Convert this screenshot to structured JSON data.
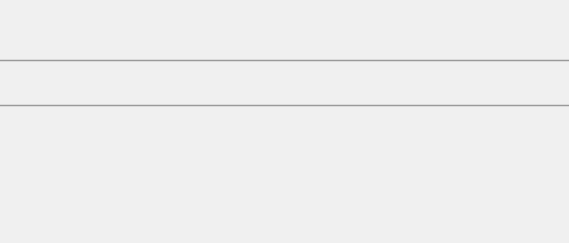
{
  "figure": {
    "background": "#f0f0f0",
    "panels": [
      {
        "letter": "a)",
        "name": "lattice-diagram",
        "cells": [
          {
            "caption_parts": {
              "u1": "u",
              "sub1": "xx",
              "eq1": " = 0; ",
              "u2": "u",
              "sub2": "yy",
              "eq2": " = <0"
            },
            "caption": "uxx = 0; uyy = <0",
            "bulge": "in"
          },
          {
            "caption_parts": {
              "u1": "u",
              "sub1": "xx",
              "eq1": " = 0; ",
              "u2": "u",
              "sub2": "yy",
              "eq2": " = >0"
            },
            "caption": "uxx = 0; uyy = >0",
            "bulge": "out"
          }
        ]
      },
      {
        "letter": "b)",
        "name": "response-chart"
      }
    ]
  },
  "chart_data": {
    "type": "scatter",
    "title": "",
    "ylabel": "U/U0",
    "ylabel_parts": {
      "main": "U/U",
      "sub": "0"
    },
    "xlabel": "l*",
    "xlim": [
      0,
      1.18
    ],
    "ylim": [
      -0.12,
      1.08
    ],
    "xticks": [
      "0",
      "0.2",
      "0.4",
      "0.6",
      "0.8",
      "1"
    ],
    "xtick_values": [
      0,
      0.2,
      0.4,
      0.6,
      0.8,
      1.0
    ],
    "yticks": [
      "0",
      "0.2",
      "0.4",
      "0.6",
      "0.8",
      "1"
    ],
    "ytick_values": [
      0,
      0.2,
      0.4,
      0.6,
      0.8,
      1.0
    ],
    "grid": true,
    "legend_position": "center-left",
    "series": [
      {
        "name": "WIDIM; l = 11",
        "label_parts": {
          "pre": "WIDIM; ",
          "var": "l",
          "eq": " = 11"
        },
        "marker": "filled-square",
        "points": [
          {
            "x": 0.115,
            "y": 0.995,
            "err": 0.02
          },
          {
            "x": 0.135,
            "y": 0.998,
            "err": 0.02
          },
          {
            "x": 0.165,
            "y": 1.0,
            "err": 0.02
          },
          {
            "x": 0.195,
            "y": 0.995,
            "err": 0.025
          },
          {
            "x": 0.235,
            "y": 0.998,
            "err": 0.025
          },
          {
            "x": 0.275,
            "y": 1.0,
            "err": 0.03
          },
          {
            "x": 0.315,
            "y": 0.995,
            "err": 0.03
          },
          {
            "x": 0.355,
            "y": 1.0,
            "err": 0.035
          },
          {
            "x": 0.4,
            "y": 0.99,
            "err": 0.045
          },
          {
            "x": 0.44,
            "y": 0.995,
            "err": 0.05
          },
          {
            "x": 0.52,
            "y": 1.0,
            "err": 0.06
          },
          {
            "x": 0.555,
            "y": 0.975,
            "err": 0.065
          }
        ]
      },
      {
        "name": "WIDIM; l = 21",
        "label_parts": {
          "pre": "WIDIM; ",
          "var": "l",
          "eq": " = 21"
        },
        "marker": "filled-triangle",
        "points": [
          {
            "x": 0.155,
            "y": 0.998,
            "err": 0.02
          },
          {
            "x": 0.185,
            "y": 1.0,
            "err": 0.02
          },
          {
            "x": 0.225,
            "y": 0.995,
            "err": 0.025
          },
          {
            "x": 0.265,
            "y": 1.0,
            "err": 0.025
          },
          {
            "x": 0.305,
            "y": 0.998,
            "err": 0.03
          },
          {
            "x": 0.345,
            "y": 1.0,
            "err": 0.035
          },
          {
            "x": 0.385,
            "y": 0.998,
            "err": 0.04
          },
          {
            "x": 0.515,
            "y": 1.0,
            "err": 0.06
          },
          {
            "x": 0.695,
            "y": 0.975,
            "err": 0.075
          },
          {
            "x": 1.045,
            "y": 0.345,
            "err": 0.145
          }
        ]
      },
      {
        "name": "WIDIM; l = 31",
        "label_parts": {
          "pre": "WIDIM; ",
          "var": "l",
          "eq": " = 31"
        },
        "marker": "filled-circle",
        "points": [
          {
            "x": 0.245,
            "y": 1.0,
            "err": 0.025
          },
          {
            "x": 0.295,
            "y": 0.998,
            "err": 0.03
          },
          {
            "x": 0.335,
            "y": 1.0,
            "err": 0.035
          },
          {
            "x": 0.375,
            "y": 0.995,
            "err": 0.04
          },
          {
            "x": 0.435,
            "y": 0.99,
            "err": 0.05
          },
          {
            "x": 0.475,
            "y": 0.985,
            "err": 0.055
          },
          {
            "x": 0.535,
            "y": 0.985,
            "err": 0.065
          },
          {
            "x": 0.615,
            "y": 1.0,
            "err": 0.075
          },
          {
            "x": 0.775,
            "y": 0.915,
            "err": 0.095
          },
          {
            "x": 1.035,
            "y": 0.455,
            "err": 0.145
          }
        ]
      },
      {
        "name": "W + 2nd ord; l = 11",
        "label_parts": {
          "pre": "W + 2",
          "sup": "nd",
          "mid": " ord; ",
          "var": "l",
          "eq": " = 11"
        },
        "marker": "open-square",
        "points": [
          {
            "x": 0.13,
            "y": 0.955,
            "err": 0.02
          },
          {
            "x": 0.155,
            "y": 0.945,
            "err": 0.02
          },
          {
            "x": 0.185,
            "y": 0.93,
            "err": 0.022
          },
          {
            "x": 0.215,
            "y": 0.895,
            "err": 0.025
          },
          {
            "x": 0.245,
            "y": 0.865,
            "err": 0.028
          },
          {
            "x": 0.275,
            "y": 0.815,
            "err": 0.03
          },
          {
            "x": 0.305,
            "y": 0.8,
            "err": 0.033
          },
          {
            "x": 0.335,
            "y": 0.775,
            "err": 0.036
          },
          {
            "x": 0.365,
            "y": 0.715,
            "err": 0.04
          },
          {
            "x": 0.395,
            "y": 0.675,
            "err": 0.045
          },
          {
            "x": 0.435,
            "y": 0.665,
            "err": 0.05
          },
          {
            "x": 0.515,
            "y": 0.44,
            "err": 0.06
          },
          {
            "x": 0.575,
            "y": 0.335,
            "err": 0.065
          },
          {
            "x": 0.775,
            "y": 0.25,
            "err": 0.085
          },
          {
            "x": 1.035,
            "y": -0.045,
            "err": 0.12
          }
        ]
      },
      {
        "name": "W + 2nd ord; l = 21",
        "label_parts": {
          "pre": "W + 2",
          "sup": "nd",
          "mid": " ord; ",
          "var": "l",
          "eq": " = 21"
        },
        "marker": "open-triangle",
        "points": [
          {
            "x": 0.175,
            "y": 0.935,
            "err": 0.02
          },
          {
            "x": 0.205,
            "y": 0.905,
            "err": 0.022
          },
          {
            "x": 0.265,
            "y": 0.825,
            "err": 0.028
          },
          {
            "x": 0.295,
            "y": 0.805,
            "err": 0.032
          },
          {
            "x": 0.325,
            "y": 0.785,
            "err": 0.035
          },
          {
            "x": 0.355,
            "y": 0.73,
            "err": 0.04
          },
          {
            "x": 0.405,
            "y": 0.675,
            "err": 0.046
          },
          {
            "x": 0.455,
            "y": 0.665,
            "err": 0.05
          },
          {
            "x": 0.545,
            "y": 0.47,
            "err": 0.062
          },
          {
            "x": 0.695,
            "y": 0.335,
            "err": 0.08
          },
          {
            "x": 1.045,
            "y": 0.02,
            "err": 0.13
          }
        ]
      },
      {
        "name": "W + 2nd ord; l = 31",
        "label_parts": {
          "pre": "W + 2",
          "sup": "nd",
          "mid": " ord; ",
          "var": "l",
          "eq": " = 31"
        },
        "marker": "open-circle",
        "points": [
          {
            "x": 0.225,
            "y": 0.875,
            "err": 0.025
          },
          {
            "x": 0.255,
            "y": 0.845,
            "err": 0.028
          },
          {
            "x": 0.285,
            "y": 0.81,
            "err": 0.032
          },
          {
            "x": 0.315,
            "y": 0.795,
            "err": 0.035
          },
          {
            "x": 0.345,
            "y": 0.745,
            "err": 0.04
          },
          {
            "x": 0.385,
            "y": 0.695,
            "err": 0.045
          },
          {
            "x": 0.425,
            "y": 0.67,
            "err": 0.05
          },
          {
            "x": 0.525,
            "y": 0.585,
            "err": 0.06
          },
          {
            "x": 0.605,
            "y": 0.455,
            "err": 0.07
          },
          {
            "x": 0.775,
            "y": 0.25,
            "err": 0.09
          },
          {
            "x": 1.035,
            "y": -0.05,
            "err": 0.125
          }
        ]
      }
    ],
    "curves": [
      {
        "name": "sin(l*)/l*",
        "style": "solid",
        "label_parts": {
          "pre": "sin(",
          "var": "l",
          "post": "*)/",
          "var2": "l",
          "post2": "*"
        },
        "k": 1
      },
      {
        "name": "sin(l*/2)/(l*/2)",
        "style": "dashed",
        "label_parts": {
          "pre": "sin(",
          "var": "l",
          "post": "*/2)/(",
          "var2": "l",
          "post2": "*/2)"
        },
        "k": 2
      },
      {
        "name": "sin(l*/3)/(l*/3)",
        "style": "dotted",
        "label_parts": {
          "pre": "sin(",
          "var": "l",
          "post": "*/3)/(",
          "var2": "l",
          "post2": "*/3)"
        },
        "k": 3
      }
    ]
  }
}
